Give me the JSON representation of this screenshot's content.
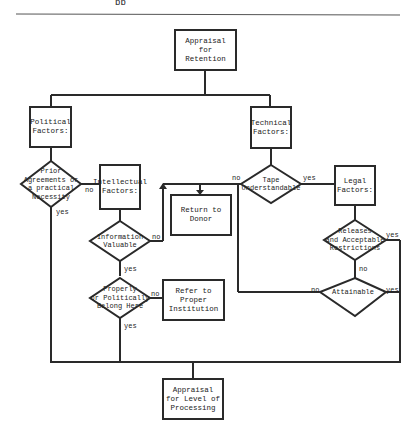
{
  "page": {
    "top_fragment": "pp",
    "rule_color": "#555555"
  },
  "flowchart": {
    "nodes": {
      "appraisal_retention": "Appraisal\nfor\nRetention",
      "political_factors": "Political\nFactors:",
      "technical_factors": "Technical\nFactors:",
      "prior_agreements": "Prior\nAgreements or\na practical\nNecessity",
      "intellectual_factors": "Intellectual\nFactors:",
      "tape_understandable": "Tape\nUnderstandable",
      "legal_factors": "Legal\nFactors:",
      "return_to_donor": "Return to\nDonor",
      "information_valuable": "Information\nValuable",
      "releases_restrictions": "Releases\nand Acceptable\nRestrictions",
      "properly_politically": "Properly\nor Politically\nBelong Here",
      "refer_institution": "Refer to\nProper\nInstitution",
      "attainable": "Attainable",
      "appraisal_processing": "Appraisal\nfor Level of\nProcessing"
    },
    "edge_labels": {
      "prior_no": "no",
      "prior_yes": "yes",
      "tape_no": "no",
      "tape_yes": "yes",
      "info_no": "no",
      "info_yes": "yes",
      "releases_yes": "yes",
      "releases_no": "no",
      "properly_no": "no",
      "properly_yes": "yes",
      "attainable_no": "no",
      "attainable_yes": "yes"
    },
    "line_color": "#2a2a2a"
  }
}
